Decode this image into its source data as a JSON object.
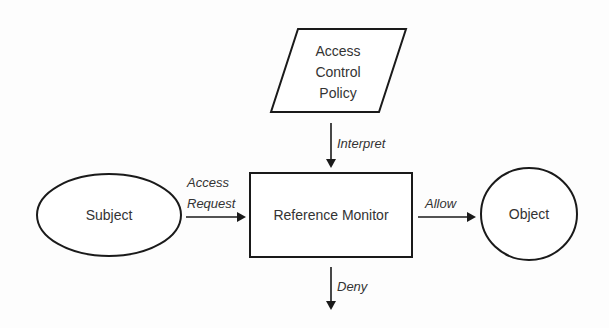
{
  "diagram": {
    "nodes": {
      "policy": {
        "shape": "parallelogram",
        "lines": [
          "Access",
          "Control",
          "Policy"
        ]
      },
      "subject": {
        "shape": "ellipse",
        "label": "Subject"
      },
      "monitor": {
        "shape": "rectangle",
        "label": "Reference Monitor"
      },
      "object": {
        "shape": "circle",
        "label": "Object"
      }
    },
    "edges": {
      "interpret": {
        "from": "Access Control Policy",
        "to": "Reference Monitor",
        "label": "Interpret"
      },
      "access_request": {
        "from": "Subject",
        "to": "Reference Monitor",
        "lines": [
          "Access",
          "Request"
        ]
      },
      "allow": {
        "from": "Reference Monitor",
        "to": "Object",
        "label": "Allow"
      },
      "deny": {
        "from": "Reference Monitor",
        "to": "",
        "label": "Deny"
      }
    },
    "colors": {
      "stroke": "#1a1a1a",
      "text": "#333333",
      "background": "#ffffff"
    }
  }
}
